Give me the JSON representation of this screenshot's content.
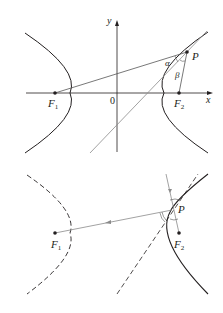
{
  "figure_top": {
    "axis_labels": {
      "x": "x",
      "y": "y",
      "origin": "0"
    },
    "points": {
      "F1": {
        "label": "F",
        "sub": "1"
      },
      "F2": {
        "label": "F",
        "sub": "2"
      },
      "P": {
        "label": "P"
      }
    },
    "angles": {
      "alpha": "α",
      "beta": "β"
    }
  },
  "figure_bottom": {
    "points": {
      "F1": {
        "label": "F",
        "sub": "1"
      },
      "F2": {
        "label": "F",
        "sub": "2"
      },
      "P": {
        "label": "P"
      }
    }
  },
  "colors": {
    "curve": "#231f20",
    "axis": "#231f20",
    "line": "#555555",
    "ray": "#8a8a8a"
  }
}
